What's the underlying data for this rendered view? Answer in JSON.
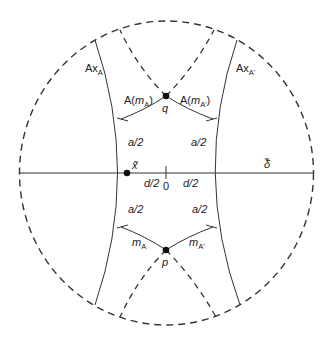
{
  "diagram": {
    "type": "hyperbolic-disk-geodesics",
    "colors": {
      "stroke": "#333333",
      "background": "#ffffff",
      "point": "#111111"
    },
    "labels": {
      "ax_a": "Ax",
      "ax_a_sub": "A",
      "ax_a_prime": "Ax",
      "ax_a_prime_sub": "A'",
      "a_m_a_prefix": "A(",
      "a_m_a_var": "m",
      "a_m_a_sub": "A",
      "a_m_a_suffix": ")",
      "a_m_a_prime_prefix": "A(",
      "a_m_a_prime_var": "m",
      "a_m_a_prime_sub": "A'",
      "a_m_a_prime_suffix": ")",
      "q": "q",
      "p": "p",
      "x_tilde": "x̃",
      "delta_tilde": "δ̃",
      "zero": "0",
      "d_half_left": "d/2",
      "d_half_right": "d/2",
      "a_half_ul": "a/2",
      "a_half_ur": "a/2",
      "a_half_ll": "a/2",
      "a_half_lr": "a/2",
      "m_a_var": "m",
      "m_a_sub": "A",
      "m_a_prime_var": "m",
      "m_a_prime_sub": "A'"
    },
    "points": [
      {
        "name": "q",
        "x": 166,
        "y": 96
      },
      {
        "name": "p",
        "x": 166,
        "y": 250
      },
      {
        "name": "x-tilde",
        "x": 127,
        "y": 173
      }
    ]
  }
}
